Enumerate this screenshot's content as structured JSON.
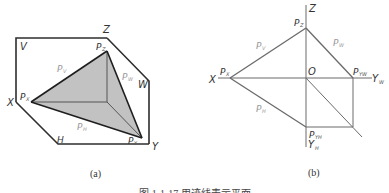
{
  "figure": {
    "caption": "图 1-1-17   用迹线表示平面",
    "colors": {
      "frame_stroke": "#2e2e2e",
      "trace_stroke": "#6a6a6a",
      "plane_fill": "#c2c2c2",
      "label_dark": "#333333",
      "label_light": "#9a9a9a"
    }
  },
  "panel_a": {
    "sublabel": "(a)",
    "planes": {
      "V": "V",
      "W": "W",
      "H": "H"
    },
    "axes": {
      "X": "X",
      "Y": "Y",
      "Z": "Z"
    },
    "points": {
      "Px": {
        "main": "P",
        "sub": "X"
      },
      "Py": {
        "main": "P",
        "sub": "Y"
      },
      "Pz": {
        "main": "P",
        "sub": "Z"
      }
    },
    "traces": {
      "Pv": {
        "main": "P",
        "sub": "V"
      },
      "Pw": {
        "main": "P",
        "sub": "W"
      },
      "Ph": {
        "main": "P",
        "sub": "H"
      }
    }
  },
  "panel_b": {
    "sublabel": "(b)",
    "axes": {
      "X": "X",
      "Z": "Z",
      "O": "O",
      "Yw": {
        "main": "Y",
        "sub": "W"
      },
      "Yh": {
        "main": "Y",
        "sub": "H"
      }
    },
    "points": {
      "Px": {
        "main": "P",
        "sub": "X"
      },
      "Pz": {
        "main": "P",
        "sub": "Z"
      },
      "Pyw": {
        "main": "P",
        "sub": "YW"
      },
      "Pyh": {
        "main": "P",
        "sub": "YH"
      }
    },
    "traces": {
      "Pv": {
        "main": "P",
        "sub": "V"
      },
      "Pw": {
        "main": "P",
        "sub": "W"
      },
      "Ph": {
        "main": "P",
        "sub": "H"
      }
    }
  }
}
